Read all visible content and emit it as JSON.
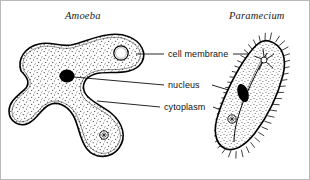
{
  "figure": {
    "name": "protozoa-comparison-diagram",
    "background": "#ffffff",
    "border_color": "#b9b9b9",
    "ink_color": "#000000",
    "stipple_color": "#4a4a4a"
  },
  "organisms": [
    {
      "id": "amoeba",
      "title": "Amoeba",
      "title_style": "italic",
      "structures": [
        "cell membrane",
        "nucleus",
        "cytoplasm",
        "contractile vacuole",
        "food vacuole"
      ]
    },
    {
      "id": "paramecium",
      "title": "Paramecium",
      "title_style": "italic",
      "structures": [
        "cilia",
        "contractile vacuole",
        "macronucleus",
        "oral groove",
        "cytoplasm"
      ]
    }
  ],
  "labels": [
    {
      "id": "cell-membrane",
      "text": "cell membrane"
    },
    {
      "id": "nucleus",
      "text": "nucleus"
    },
    {
      "id": "cytoplasm",
      "text": "cytoplasm"
    }
  ]
}
